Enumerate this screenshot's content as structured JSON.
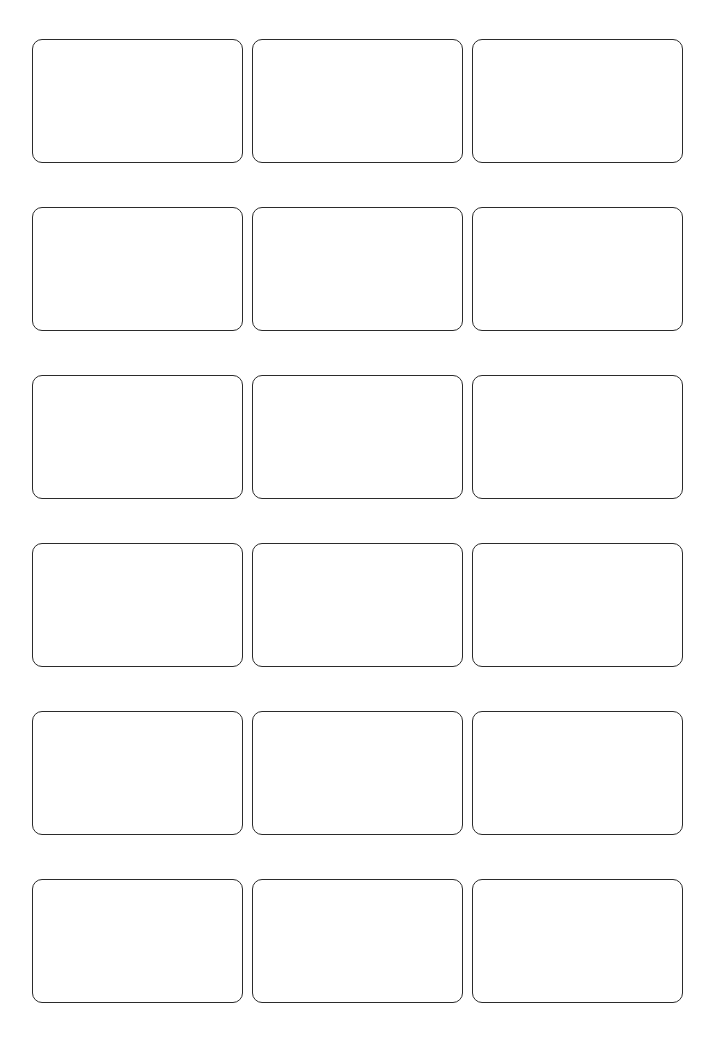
{
  "page": {
    "background_color": "#ffffff",
    "width_px": 720,
    "height_px": 1050
  },
  "grid": {
    "columns": 3,
    "rows": 6,
    "total_cards": 18,
    "card_width_px": 211,
    "card_height_px": 124,
    "column_gap_px": 9,
    "row_gap_px": 44,
    "margin_left_px": 32,
    "margin_top_px": 39,
    "card_border_color": "#2b2b2b",
    "card_border_width_px": 1.5,
    "card_corner_radius_px": 10,
    "card_fill_color": "#ffffff"
  },
  "cards": [
    {
      "index": 1,
      "row": 1,
      "column": 1,
      "content": ""
    },
    {
      "index": 2,
      "row": 1,
      "column": 2,
      "content": ""
    },
    {
      "index": 3,
      "row": 1,
      "column": 3,
      "content": ""
    },
    {
      "index": 4,
      "row": 2,
      "column": 1,
      "content": ""
    },
    {
      "index": 5,
      "row": 2,
      "column": 2,
      "content": ""
    },
    {
      "index": 6,
      "row": 2,
      "column": 3,
      "content": ""
    },
    {
      "index": 7,
      "row": 3,
      "column": 1,
      "content": ""
    },
    {
      "index": 8,
      "row": 3,
      "column": 2,
      "content": ""
    },
    {
      "index": 9,
      "row": 3,
      "column": 3,
      "content": ""
    },
    {
      "index": 10,
      "row": 4,
      "column": 1,
      "content": ""
    },
    {
      "index": 11,
      "row": 4,
      "column": 2,
      "content": ""
    },
    {
      "index": 12,
      "row": 4,
      "column": 3,
      "content": ""
    },
    {
      "index": 13,
      "row": 5,
      "column": 1,
      "content": ""
    },
    {
      "index": 14,
      "row": 5,
      "column": 2,
      "content": ""
    },
    {
      "index": 15,
      "row": 5,
      "column": 3,
      "content": ""
    },
    {
      "index": 16,
      "row": 6,
      "column": 1,
      "content": ""
    },
    {
      "index": 17,
      "row": 6,
      "column": 2,
      "content": ""
    },
    {
      "index": 18,
      "row": 6,
      "column": 3,
      "content": ""
    }
  ]
}
